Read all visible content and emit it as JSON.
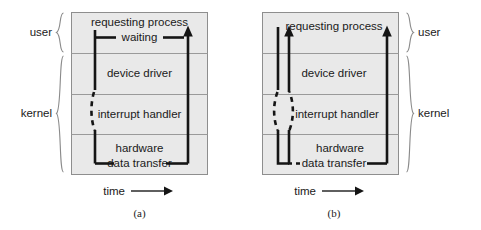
{
  "figure": {
    "background_color": "#ffffff",
    "box_fill_color": "#e9e9e9",
    "box_border_color": "#8e8e8e",
    "line_color": "#151515",
    "brace_color": "#8a8a8a"
  },
  "panels": [
    {
      "id": "a",
      "caption": "(a)",
      "brace_side": "left",
      "rows": [
        {
          "key": "requesting_process",
          "label": "requesting process"
        },
        {
          "key": "device_driver",
          "label": "device driver"
        },
        {
          "key": "interrupt_handler",
          "label": "interrupt handler"
        },
        {
          "key": "hardware",
          "label": "hardware"
        }
      ],
      "groups": [
        {
          "key": "user",
          "label": "user",
          "rows": [
            "requesting process"
          ]
        },
        {
          "key": "kernel",
          "label": "kernel",
          "rows": [
            "device driver",
            "interrupt handler",
            "hardware"
          ]
        }
      ],
      "annotations": [
        {
          "key": "waiting",
          "label": "waiting",
          "row": "requesting process"
        },
        {
          "key": "data_transfer",
          "label": "data transfer",
          "row": "hardware"
        }
      ],
      "axis": {
        "label": "time",
        "arrow": "right"
      }
    },
    {
      "id": "b",
      "caption": "(b)",
      "brace_side": "right",
      "rows": [
        {
          "key": "requesting_process",
          "label": "requesting process"
        },
        {
          "key": "device_driver",
          "label": "device driver"
        },
        {
          "key": "interrupt_handler",
          "label": "interrupt handler"
        },
        {
          "key": "hardware",
          "label": "hardware"
        }
      ],
      "groups": [
        {
          "key": "user",
          "label": "user",
          "rows": [
            "requesting process"
          ]
        },
        {
          "key": "kernel",
          "label": "kernel",
          "rows": [
            "device driver",
            "interrupt handler",
            "hardware"
          ]
        }
      ],
      "annotations": [
        {
          "key": "data_transfer",
          "label": "data transfer",
          "row": "hardware"
        }
      ],
      "axis": {
        "label": "time",
        "arrow": "right"
      }
    }
  ]
}
